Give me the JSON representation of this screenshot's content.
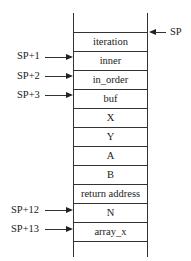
{
  "diagram": {
    "type": "stack-frame",
    "cells": [
      {
        "label": "iteration"
      },
      {
        "label": "inner"
      },
      {
        "label": "in_order"
      },
      {
        "label": "buf"
      },
      {
        "label": "X"
      },
      {
        "label": "Y"
      },
      {
        "label": "A"
      },
      {
        "label": "B"
      },
      {
        "label": "return address"
      },
      {
        "label": "N"
      },
      {
        "label": "array_x"
      }
    ],
    "pointers": {
      "sp": {
        "label": "SP",
        "target": "iteration",
        "side": "right"
      },
      "sp1": {
        "label": "SP+1",
        "target": "inner",
        "side": "left"
      },
      "sp2": {
        "label": "SP+2",
        "target": "in_order",
        "side": "left"
      },
      "sp3": {
        "label": "SP+3",
        "target": "buf",
        "side": "left"
      },
      "sp12": {
        "label": "SP+12",
        "target": "N",
        "side": "left"
      },
      "sp13": {
        "label": "SP+13",
        "target": "array_x",
        "side": "left"
      }
    }
  }
}
